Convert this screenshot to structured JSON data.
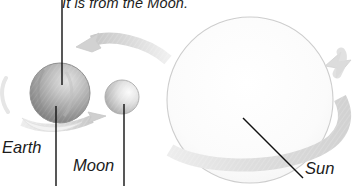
{
  "figure": {
    "name": "earth-moon-sun-orbit-diagram",
    "background_color": "#ffffff",
    "caption_top": "It is from the Moon.",
    "labels": {
      "earth": "Earth",
      "moon": "Moon",
      "sun": "Sun"
    },
    "text_color": "#1c1c1c",
    "leader_line_color": "#111111"
  },
  "bodies": {
    "earth": {
      "name": "Earth",
      "center_x": 60,
      "center_y": 93,
      "radius": 30,
      "fill_light": "#d8d8d8",
      "fill_dark": "#7e7e7e",
      "edge_color": "#9a9a9a"
    },
    "moon": {
      "name": "Moon",
      "center_x": 122,
      "center_y": 97,
      "radius": 17,
      "fill_light": "#f2f2f2",
      "fill_dark": "#a8a8a8",
      "edge_color": "#b0b0b0"
    },
    "sun": {
      "name": "Sun",
      "center_x": 250,
      "center_y": 100,
      "radius": 83,
      "fill_light": "#ffffff",
      "fill_dark": "#f1f1f1",
      "edge_color": "#cfcfcf"
    }
  },
  "arrows": {
    "earth_orbit_arrow": {
      "name": "earth-orbit-arrow-left",
      "direction": "left",
      "color": "#d4d4d4"
    },
    "earth_rotation_arrow": {
      "name": "earth-rotation-arrow-right",
      "direction": "right",
      "color": "#dcdcdc"
    },
    "sun_orbit_band": {
      "name": "sun-orbit-band-arrow-up",
      "direction": "up",
      "color": "#dedede"
    }
  }
}
